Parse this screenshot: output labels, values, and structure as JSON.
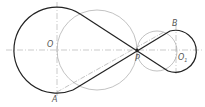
{
  "diagram": {
    "type": "geometric construction: crossed belt tangents between two circles",
    "labels": {
      "O": "O",
      "O1": "O",
      "O1_sub": "1",
      "A": "A",
      "B": "B",
      "P": "P"
    },
    "colors": {
      "thick": "#222222",
      "thin": "#999999",
      "center_line": "#aaaaaa",
      "label": "#555555"
    },
    "geometry": {
      "circle_O": {
        "cx": 57,
        "cy": 50,
        "r": 43
      },
      "circle_O1": {
        "cx": 176,
        "cy": 51,
        "r": 21
      },
      "point_P": {
        "x": 137,
        "y": 50
      },
      "point_A": {
        "x": 57,
        "y": 92
      },
      "point_B": {
        "x": 176,
        "y": 30
      }
    }
  }
}
